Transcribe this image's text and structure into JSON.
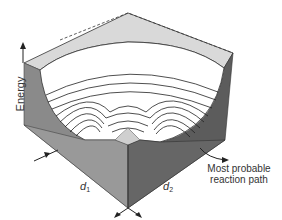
{
  "figure": {
    "axis_label_energy": "Energy",
    "d1": {
      "symbol": "d",
      "subscript": "1"
    },
    "d2": {
      "symbol": "d",
      "subscript": "2"
    },
    "path_label_line1": "Most probable",
    "path_label_line2": "reaction path"
  },
  "colors": {
    "top_face": "#d8d8d8",
    "left_face": "#8a8a8a",
    "right_face": "#5c5c5c",
    "front_left_face": "#9a9a9a",
    "front_right_face": "#6a6a6a",
    "contour_line": "#222222",
    "surface": "#ffffff"
  }
}
